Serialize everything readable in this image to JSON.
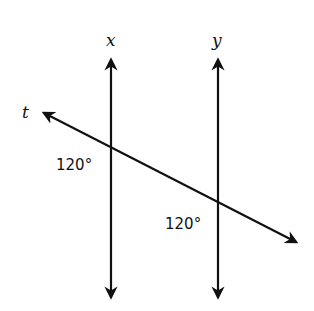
{
  "diagram": {
    "type": "parallel-lines-transversal",
    "lines": {
      "x": {
        "label": "x"
      },
      "y": {
        "label": "y"
      },
      "t": {
        "label": "t"
      }
    },
    "angles": [
      {
        "label": "120°",
        "at": "intersection of t and x"
      },
      {
        "label": "120°",
        "at": "intersection of t and y"
      }
    ]
  }
}
